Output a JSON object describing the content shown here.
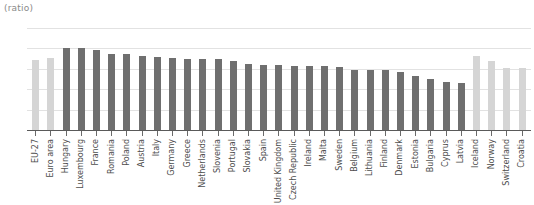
{
  "chart_data": {
    "type": "bar",
    "title": "",
    "unit_label": "(ratio)",
    "xlabel": "",
    "ylabel": "",
    "ylim": [
      0,
      1.25
    ],
    "ytick_labels": [
      "1.25",
      "1.00",
      "0.75",
      "0.50",
      "0.25",
      "0"
    ],
    "ytick_values": [
      1.25,
      1.0,
      0.75,
      0.5,
      0.25,
      0
    ],
    "grid": true,
    "legend": "none",
    "colors": {
      "aggregate_bar": "#d5d5d5",
      "country_bar": "#6f6f6f",
      "gridline": "#e2e2e2",
      "axis": "#5a5a5a",
      "tick_text": "#5d5d5d",
      "category_text": "#4d4d4d",
      "unit_text": "#8a8a8a",
      "background": "#ffffff"
    },
    "categories": [
      "EU-27",
      "Euro area",
      "Hungary",
      "Luxembourg",
      "France",
      "Romania",
      "Poland",
      "Austria",
      "Italy",
      "Germany",
      "Greece",
      "Netherlands",
      "Slovenia",
      "Portugal",
      "Slovakia",
      "Spain",
      "United Kingdom",
      "Czech Republic",
      "Ireland",
      "Malta",
      "Sweden",
      "Belgium",
      "Lithuania",
      "Finland",
      "Denmark",
      "Estonia",
      "Bulgaria",
      "Cyprus",
      "Latvia",
      "Iceland",
      "Norway",
      "Switzerland",
      "Croatia"
    ],
    "values": [
      0.86,
      0.88,
      1.01,
      1.0,
      0.98,
      0.93,
      0.93,
      0.91,
      0.9,
      0.88,
      0.87,
      0.87,
      0.87,
      0.85,
      0.81,
      0.8,
      0.8,
      0.78,
      0.78,
      0.78,
      0.77,
      0.74,
      0.73,
      0.73,
      0.71,
      0.66,
      0.63,
      0.59,
      0.58,
      0.91,
      0.84,
      0.76,
      0.76
    ],
    "series_styles": [
      "light",
      "light",
      "dark",
      "dark",
      "dark",
      "dark",
      "dark",
      "dark",
      "dark",
      "dark",
      "dark",
      "dark",
      "dark",
      "dark",
      "dark",
      "dark",
      "dark",
      "dark",
      "dark",
      "dark",
      "dark",
      "dark",
      "dark",
      "dark",
      "dark",
      "dark",
      "dark",
      "dark",
      "dark",
      "light",
      "light",
      "light",
      "light"
    ]
  }
}
